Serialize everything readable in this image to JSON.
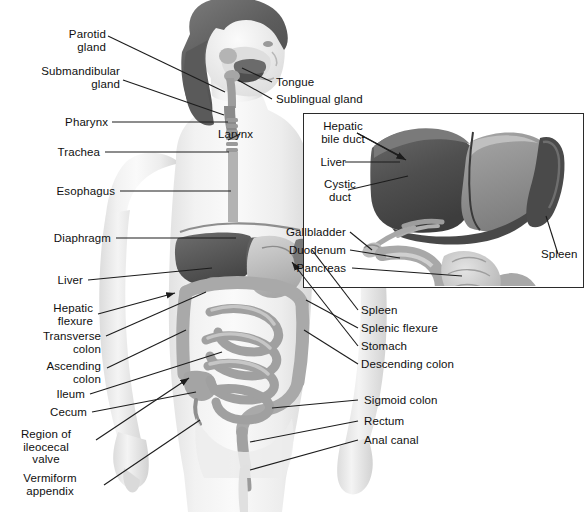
{
  "figure": {
    "background_color": "#ffffff",
    "label_color": "#101010",
    "leader_line_color": "#1c1c1c",
    "inset": {
      "name": "liver-gallbladder-pancreas-inset",
      "border_color": "#2b2b2b",
      "background_color": "#ffffff"
    }
  },
  "main_labels_left": [
    {
      "id": "parotid-gland",
      "text": "Parotid\ngland"
    },
    {
      "id": "submandibular-gland",
      "text": "Submandibular\ngland"
    },
    {
      "id": "pharynx",
      "text": "Pharynx"
    },
    {
      "id": "trachea",
      "text": "Trachea"
    },
    {
      "id": "esophagus",
      "text": "Esophagus"
    },
    {
      "id": "diaphragm",
      "text": "Diaphragm"
    },
    {
      "id": "liver",
      "text": "Liver"
    },
    {
      "id": "hepatic-flexure",
      "text": "Hepatic\nflexure"
    },
    {
      "id": "transverse-colon",
      "text": "Transverse\ncolon"
    },
    {
      "id": "ascending-colon",
      "text": "Ascending\ncolon"
    },
    {
      "id": "ileum",
      "text": "Ileum"
    },
    {
      "id": "cecum",
      "text": "Cecum"
    },
    {
      "id": "region-of-ileocecal-valve",
      "text": "Region of\nileocecal\nvalve"
    },
    {
      "id": "vermiform-appendix",
      "text": "Vermiform\nappendix"
    }
  ],
  "main_labels_right": [
    {
      "id": "tongue",
      "text": "Tongue"
    },
    {
      "id": "sublingual-gland",
      "text": "Sublingual gland"
    },
    {
      "id": "larynx",
      "text": "Larynx"
    },
    {
      "id": "spleen",
      "text": "Spleen"
    },
    {
      "id": "splenic-flexure",
      "text": "Splenic flexure"
    },
    {
      "id": "stomach",
      "text": "Stomach"
    },
    {
      "id": "descending-colon",
      "text": "Descending colon"
    },
    {
      "id": "sigmoid-colon",
      "text": "Sigmoid colon"
    },
    {
      "id": "rectum",
      "text": "Rectum"
    },
    {
      "id": "anal-canal",
      "text": "Anal canal"
    }
  ],
  "inset_labels_left": [
    {
      "id": "hepatic-bile-duct",
      "text": "Hepatic\nbile duct"
    },
    {
      "id": "inset-liver",
      "text": "Liver"
    },
    {
      "id": "cystic-duct",
      "text": "Cystic\nduct"
    },
    {
      "id": "gallbladder",
      "text": "Gallbladder"
    },
    {
      "id": "duodenum",
      "text": "Duodenum"
    },
    {
      "id": "pancreas",
      "text": "Pancreas"
    }
  ],
  "inset_labels_right": [
    {
      "id": "inset-spleen",
      "text": "Spleen"
    }
  ]
}
